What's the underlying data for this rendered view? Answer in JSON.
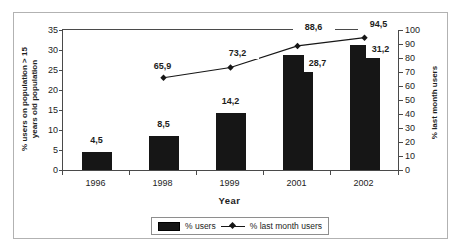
{
  "chart_data": {
    "type": "bar",
    "categories": [
      "1996",
      "1998",
      "1999",
      "2001",
      "2002"
    ],
    "series": [
      {
        "name": "% users",
        "type": "bar",
        "axis": "left",
        "values": [
          4.5,
          8.5,
          14.2,
          28.7,
          31.2
        ],
        "value_labels": [
          "4,5",
          "8,5",
          "14,2",
          "28,7",
          "31,2"
        ]
      },
      {
        "name": "% last month users",
        "type": "line",
        "axis": "right",
        "marker": "diamond",
        "values": [
          null,
          65.9,
          73.2,
          88.6,
          94.5
        ],
        "value_labels": [
          null,
          "65,9",
          "73,2",
          "88,6",
          "94,5"
        ]
      }
    ],
    "xlabel": "Year",
    "ylabel_left_line1": "% users on population > 15",
    "ylabel_left_line2": "years old population",
    "ylabel_right": "% last month users",
    "left_axis": {
      "min": 0,
      "max": 35,
      "step": 5,
      "ticks": [
        0,
        5,
        10,
        15,
        20,
        25,
        30,
        35
      ]
    },
    "right_axis": {
      "min": 0,
      "max": 100,
      "step": 10,
      "ticks": [
        0,
        10,
        20,
        30,
        40,
        50,
        60,
        70,
        80,
        90,
        100
      ]
    },
    "legend": [
      {
        "label": "% users",
        "swatch": "bar"
      },
      {
        "label": "% last month users",
        "swatch": "line-diamond"
      }
    ],
    "colors": {
      "bar": "#161616",
      "line": "#161616",
      "text": "#1d1d1d",
      "frame": "#b2b2b2"
    },
    "grid": false,
    "legend_position": "bottom-center"
  }
}
